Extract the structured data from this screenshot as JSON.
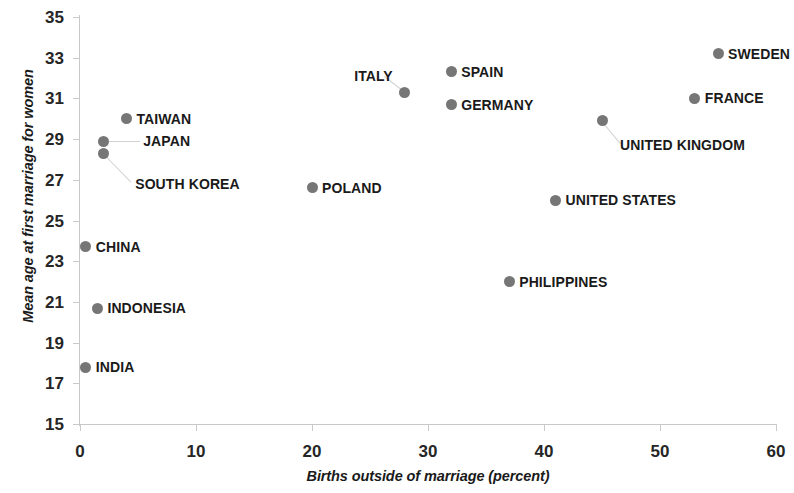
{
  "chart_data": {
    "type": "scatter",
    "title": "",
    "xlabel": "Births outside of marriage (percent)",
    "ylabel": "Mean age at first marriage for women",
    "xlim": [
      0,
      60
    ],
    "ylim": [
      15,
      35
    ],
    "xticks": [
      0,
      10,
      20,
      30,
      40,
      50,
      60
    ],
    "yticks": [
      15,
      17,
      19,
      21,
      23,
      25,
      27,
      29,
      31,
      33,
      35
    ],
    "grid": false,
    "legend": "none",
    "marker_color": "#767676",
    "points": [
      {
        "label": "INDIA",
        "x": 0.5,
        "y": 17.8,
        "label_side": "right",
        "label_dx": 10,
        "label_dy": 0
      },
      {
        "label": "INDONESIA",
        "x": 1.5,
        "y": 20.7,
        "label_side": "right",
        "label_dx": 10,
        "label_dy": 0
      },
      {
        "label": "CHINA",
        "x": 0.5,
        "y": 23.7,
        "label_side": "right",
        "label_dx": 10,
        "label_dy": 0
      },
      {
        "label": "PHILIPPINES",
        "x": 37.0,
        "y": 22.0,
        "label_side": "right",
        "label_dx": 10,
        "label_dy": 0
      },
      {
        "label": "UNITED STATES",
        "x": 41.0,
        "y": 26.0,
        "label_side": "right",
        "label_dx": 10,
        "label_dy": 0
      },
      {
        "label": "POLAND",
        "x": 20.0,
        "y": 26.6,
        "label_side": "right",
        "label_dx": 10,
        "label_dy": 0
      },
      {
        "label": "SOUTH KOREA",
        "x": 2.0,
        "y": 28.3,
        "label_side": "right",
        "label_dx": 32,
        "label_dy": 31
      },
      {
        "label": "JAPAN",
        "x": 2.0,
        "y": 28.9,
        "label_side": "right",
        "label_dx": 40,
        "label_dy": 0
      },
      {
        "label": "TAIWAN",
        "x": 4.0,
        "y": 30.0,
        "label_side": "right",
        "label_dx": 10,
        "label_dy": 0
      },
      {
        "label": "UNITED KINGDOM",
        "x": 45.0,
        "y": 29.9,
        "label_side": "right",
        "label_dx": 18,
        "label_dy": 24
      },
      {
        "label": "GERMANY",
        "x": 32.0,
        "y": 30.7,
        "label_side": "right",
        "label_dx": 10,
        "label_dy": 0
      },
      {
        "label": "ITALY",
        "x": 28.0,
        "y": 31.3,
        "label_side": "left",
        "label_dx": -12,
        "label_dy": -16
      },
      {
        "label": "FRANCE",
        "x": 53.0,
        "y": 31.0,
        "label_side": "right",
        "label_dx": 10,
        "label_dy": 0
      },
      {
        "label": "SPAIN",
        "x": 32.0,
        "y": 32.3,
        "label_side": "right",
        "label_dx": 10,
        "label_dy": 0
      },
      {
        "label": "SWEDEN",
        "x": 55.0,
        "y": 33.2,
        "label_side": "right",
        "label_dx": 10,
        "label_dy": 0
      }
    ],
    "leaders": [
      {
        "from_label": "SOUTH KOREA",
        "x1": 2.0,
        "y1": 28.3,
        "x2": 4.4,
        "y2": 26.9
      },
      {
        "from_label": "JAPAN",
        "x1": 2.0,
        "y1": 28.9,
        "x2": 5.2,
        "y2": 28.9
      },
      {
        "from_label": "ITALY",
        "x1": 28.0,
        "y1": 31.3,
        "x2": 26.2,
        "y2": 32.1
      },
      {
        "from_label": "UNITED KINGDOM",
        "x1": 45.0,
        "y1": 29.9,
        "x2": 46.6,
        "y2": 28.8
      }
    ]
  }
}
